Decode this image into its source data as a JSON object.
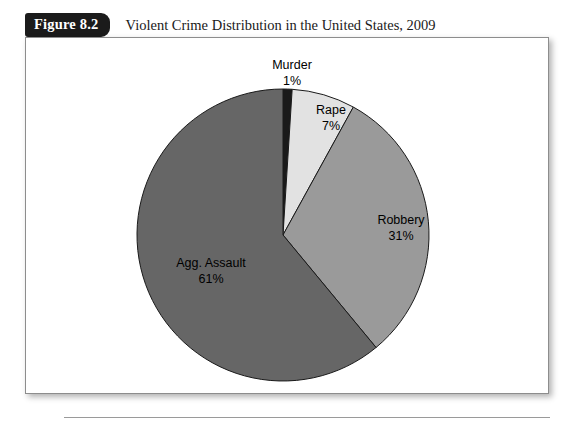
{
  "figure": {
    "tag": "Figure 8.2",
    "title": "Violent Crime Distribution in the United States, 2009"
  },
  "chart_data": {
    "type": "pie",
    "title": "Violent Crime Distribution in the United States, 2009",
    "xlabel": "",
    "ylabel": "",
    "unit": "percent",
    "total": 100,
    "legend_position": "none",
    "labels_inline": true,
    "start_angle_deg": 0,
    "direction": "clockwise",
    "grid": false,
    "categories": [
      "Murder",
      "Rape",
      "Robbery",
      "Agg. Assault"
    ],
    "values": [
      1,
      7,
      31,
      61
    ],
    "colors": [
      "#1a1a1a",
      "#e2e2e2",
      "#9a9a9a",
      "#666666"
    ],
    "slices": [
      {
        "label": "Murder",
        "value": 1,
        "percent_text": "1%",
        "color": "#1a1a1a"
      },
      {
        "label": "Rape",
        "value": 7,
        "percent_text": "7%",
        "color": "#e2e2e2"
      },
      {
        "label": "Robbery",
        "value": 31,
        "percent_text": "31%",
        "color": "#9a9a9a"
      },
      {
        "label": "Agg. Assault",
        "value": 61,
        "percent_text": "61%",
        "color": "#666666"
      }
    ]
  }
}
